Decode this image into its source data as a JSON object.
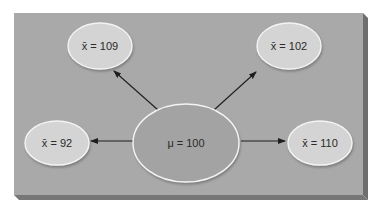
{
  "diagram": {
    "colors": {
      "panel": "#a9a9a9",
      "panel_edge": "#6e6e6e",
      "small_ellipse_fill": "#d4d4d4",
      "center_ellipse_fill": "#a3a3a3",
      "ellipse_stroke": "#f2f2f2",
      "arrow": "#1e1e1e"
    },
    "center": {
      "symbol": "μ",
      "equals": "=",
      "value": "100",
      "label": "μ = 100"
    },
    "samples": [
      {
        "position": "top-left",
        "symbol": "x̄",
        "value": "109",
        "label": "x̄ = 109"
      },
      {
        "position": "top-right",
        "symbol": "x̄",
        "value": "102",
        "label": "x̄ = 102"
      },
      {
        "position": "left",
        "symbol": "x̄",
        "value": "92",
        "label": "x̄ = 92"
      },
      {
        "position": "right",
        "symbol": "x̄",
        "value": "110",
        "label": "x̄ = 110"
      }
    ]
  }
}
